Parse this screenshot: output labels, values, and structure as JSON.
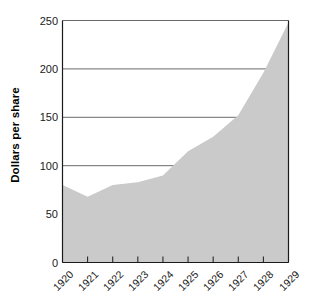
{
  "chart_data": {
    "type": "area",
    "title": "",
    "xlabel": "",
    "ylabel": "Dollars per share",
    "categories": [
      "1920",
      "1921",
      "1922",
      "1923",
      "1924",
      "1925",
      "1926",
      "1927",
      "1928",
      "1929"
    ],
    "values": [
      80,
      68,
      80,
      83,
      90,
      115,
      130,
      152,
      196,
      248
    ],
    "series": [
      {
        "name": "Dollars per share",
        "values": [
          80,
          68,
          80,
          83,
          90,
          115,
          130,
          152,
          196,
          248
        ]
      }
    ],
    "ylim": [
      0,
      250
    ],
    "yticks": [
      0,
      50,
      100,
      150,
      200,
      250
    ],
    "ytick_labels": [
      "0",
      "50",
      "100",
      "150",
      "200",
      "250"
    ],
    "xtick_labels": [
      "1920",
      "1921",
      "1922",
      "1923",
      "1924",
      "1925",
      "1926",
      "1927",
      "1928",
      "1929"
    ],
    "grid": true,
    "grid_axis": "y",
    "legend": false,
    "legend_position": "none",
    "xtick_label_rotation": -45,
    "colors": {
      "area_fill": "#cacaca",
      "grid_line": "#595959",
      "axis_line": "#1a1a1a",
      "text": "#1a1a1a",
      "background": "#ffffff"
    }
  },
  "figure": {
    "background": "#ffffff",
    "width": 310,
    "height": 303
  }
}
